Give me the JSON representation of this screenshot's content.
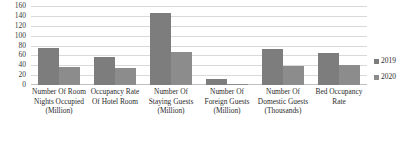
{
  "chart_data": {
    "type": "bar",
    "title": "",
    "subtitle": "",
    "xlabel": "",
    "ylabel": "",
    "ylim": [
      0,
      160
    ],
    "ytick_step": 20,
    "yticks": [
      160,
      140,
      120,
      100,
      80,
      60,
      40,
      20,
      0
    ],
    "grid": true,
    "legend_position": "right",
    "categories": [
      "Number Of Room Nights Occupied (Million)",
      "Occupancy Rate Of Hotel Room",
      "Number Of Staying Guests (Million)",
      "Number Of Foreign Guests (Million)",
      "Number Of Domestic Guests (Thousands)",
      "Bed Occupancy Rate"
    ],
    "series": [
      {
        "name": "2019",
        "color": "#7d7d7d",
        "values": [
          75,
          56,
          146,
          13,
          72,
          64
        ]
      },
      {
        "name": "2020",
        "color": "#8c8c8c",
        "values": [
          37,
          35,
          67,
          2,
          38,
          40
        ]
      }
    ]
  },
  "legend": {
    "items": [
      {
        "label": "2019",
        "marker": "square-marker"
      },
      {
        "label": "2020",
        "marker": "square-marker"
      }
    ]
  },
  "axis": {
    "y_labels": [
      "160",
      "140",
      "120",
      "100",
      "80",
      "60",
      "40",
      "20",
      "0"
    ],
    "x_labels": [
      "Number Of Room Nights Occupied (Million)",
      "Occupancy Rate Of Hotel Room",
      "Number Of Staying Guests (Million)",
      "Number Of Foreign Guests (Million)",
      "Number Of Domestic Guests (Thousands)",
      "Bed Occupancy Rate"
    ]
  },
  "colors": {
    "series_2019": "#7d7d7d",
    "series_2020": "#8c8c8c",
    "gridline": "#d9d9d9",
    "background": "#ffffff"
  }
}
